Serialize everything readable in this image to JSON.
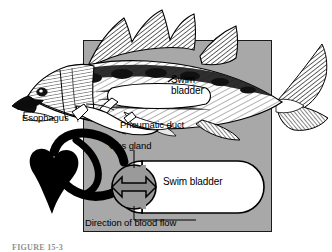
{
  "figure": {
    "caption": "FIGURE 15-3",
    "panel_color": "#a8a8a8",
    "ink_color": "#000000",
    "organ_fill": "#ffffff",
    "arrow_fill": "#8c8c8c"
  },
  "fish_diagram": {
    "name": "cutaway-fish-illustration",
    "labels": {
      "swim_bladder": "Swim\nbladder",
      "esophagus": "Esophagus",
      "pneumatic_duct": "Pneumatic duct"
    }
  },
  "schematic": {
    "name": "gas-gland-schematic",
    "labels": {
      "gas_gland": "Gas gland",
      "swim_bladder": "Swim bladder",
      "blood_flow": "Direction of blood flow"
    },
    "parts": {
      "heart": "heart-shape",
      "vessel": "blood-vessel-loop",
      "gland": "gas-gland-circle",
      "exchange_arrow": "double-headed-arrow",
      "bladder": "swim-bladder-capsule"
    }
  }
}
